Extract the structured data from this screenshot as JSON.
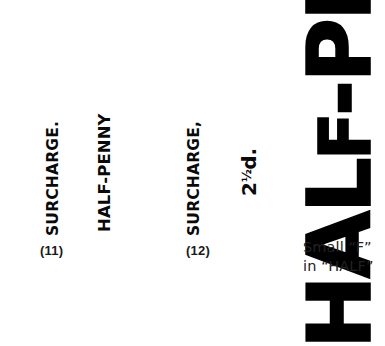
{
  "page": {
    "background_color": "#ffffff",
    "ink_color": "#000000",
    "caption_color": "#222222"
  },
  "figures": [
    {
      "number_label": "(11)",
      "overprint_lines": [
        "SURCHARGE.",
        "HALF-PENNY"
      ]
    },
    {
      "number_label": "(12)",
      "overprint_lines": [
        "SURCHARGE,",
        "2½d."
      ],
      "value_digit": "2",
      "value_fraction": "½",
      "value_suffix": "d."
    }
  ],
  "specimens": {
    "fig11_line1": "SURCHARGE.",
    "fig11_line2": "HALF-PENNY",
    "fig12_line1": "SURCHARGE,",
    "fig12_value_digit": "2",
    "fig12_value_fraction": "½",
    "fig12_value_suffix": "d."
  },
  "enlargement": {
    "text_prefix": "HAL",
    "text_small_letter": "F",
    "text_suffix": "-PE",
    "full_visible_text": "HALF-PE",
    "caption_line_1": "Small “F”",
    "caption_line_2": "in “HALF”"
  }
}
